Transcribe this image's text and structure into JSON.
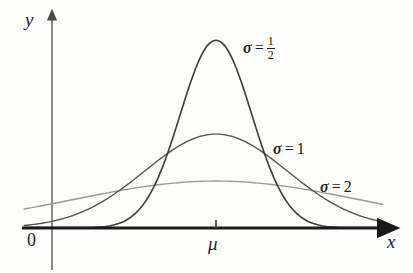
{
  "figure": {
    "background_color": "#fdfdfb",
    "width": 413,
    "height": 273
  },
  "axes": {
    "y_label": "y",
    "x_label": "x",
    "origin_label": "0",
    "mean_tick_label": "μ",
    "x_axis_color": "#1a1a1a",
    "y_axis_color": "#6e6e6e",
    "has_arrowheads": true,
    "grid": false,
    "tick_labels_x": [
      "0",
      "μ"
    ],
    "tick_labels_y": []
  },
  "labels": {
    "sigma_half": {
      "symbol": "σ",
      "equals": "=",
      "value": "1/2",
      "numerator": "1",
      "denominator": "2"
    },
    "sigma_one": {
      "symbol": "σ",
      "equals": "=",
      "value": "1"
    },
    "sigma_two": {
      "symbol": "σ",
      "equals": "=",
      "value": "2"
    }
  },
  "chart_data": {
    "type": "line",
    "title": "",
    "subtitle": "",
    "xlabel": "x",
    "ylabel": "y",
    "xlim": [
      -4.6,
      4.6
    ],
    "ylim": [
      0,
      0.92
    ],
    "grid": false,
    "legend_position": "inline-right-of-curves",
    "annotations": [
      "σ = 1/2",
      "σ = 1",
      "σ = 2"
    ],
    "x_tick_positions": [
      0
    ],
    "x_tick_text": [
      "μ"
    ],
    "series": [
      {
        "name": "σ = 1/2",
        "sigma": 0.5,
        "mu": 0,
        "peak_value": 0.7979,
        "color": "#3a3a3a",
        "line_width": 1.6,
        "x": [
          -4.6,
          -4.0,
          -3.5,
          -3.0,
          -2.5,
          -2.0,
          -1.75,
          -1.5,
          -1.25,
          -1.0,
          -0.75,
          -0.5,
          -0.25,
          0,
          0.25,
          0.5,
          0.75,
          1.0,
          1.25,
          1.5,
          1.75,
          2.0,
          2.5,
          3.0,
          3.5,
          4.0,
          4.6
        ],
        "y": [
          0.0,
          0.0,
          0.0,
          0.0,
          0.0001,
          0.0027,
          0.0088,
          0.0258,
          0.0656,
          0.108,
          0.2218,
          0.4839,
          0.7041,
          0.7979,
          0.7041,
          0.4839,
          0.2218,
          0.108,
          0.0656,
          0.0258,
          0.0088,
          0.0027,
          0.0001,
          0.0,
          0.0,
          0.0,
          0.0
        ]
      },
      {
        "name": "σ = 1",
        "sigma": 1.0,
        "mu": 0,
        "peak_value": 0.3989,
        "color": "#545454",
        "line_width": 1.4,
        "x": [
          -4.6,
          -4.0,
          -3.5,
          -3.0,
          -2.5,
          -2.0,
          -1.5,
          -1.0,
          -0.5,
          0,
          0.5,
          1.0,
          1.5,
          2.0,
          2.5,
          3.0,
          3.5,
          4.0,
          4.6
        ],
        "y": [
          0.0,
          0.0001,
          0.0009,
          0.0044,
          0.0175,
          0.054,
          0.1295,
          0.242,
          0.3521,
          0.3989,
          0.3521,
          0.242,
          0.1295,
          0.054,
          0.0175,
          0.0044,
          0.0009,
          0.0001,
          0.0
        ]
      },
      {
        "name": "σ = 2",
        "sigma": 2.0,
        "mu": 0,
        "peak_value": 0.1995,
        "color": "#9a9a9a",
        "line_width": 1.4,
        "x": [
          -4.6,
          -4.0,
          -3.5,
          -3.0,
          -2.5,
          -2.0,
          -1.5,
          -1.0,
          -0.5,
          0,
          0.5,
          1.0,
          1.5,
          2.0,
          2.5,
          3.0,
          3.5,
          4.0,
          4.6
        ],
        "y": [
          0.0582,
          0.054,
          0.0679,
          0.0863,
          0.1086,
          0.121,
          0.1506,
          0.176,
          0.1934,
          0.1995,
          0.1934,
          0.176,
          0.1506,
          0.121,
          0.1086,
          0.0863,
          0.0679,
          0.054,
          0.0582
        ]
      }
    ]
  }
}
